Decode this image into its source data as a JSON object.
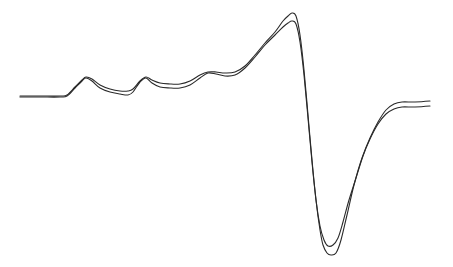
{
  "chart_data": {
    "type": "line",
    "title": "",
    "xlabel": "",
    "ylabel": "",
    "grid": false,
    "axes_visible": false,
    "legend": null,
    "x_pixel_range": [
      20,
      430
    ],
    "y_pixel_range": [
      13,
      255
    ],
    "series": [
      {
        "name": "trace-1",
        "color": "#2a2a2a",
        "points": [
          [
            20,
            96
          ],
          [
            40,
            96
          ],
          [
            60,
            96
          ],
          [
            67,
            95
          ],
          [
            75,
            87
          ],
          [
            82,
            80
          ],
          [
            86,
            77
          ],
          [
            92,
            79
          ],
          [
            100,
            85
          ],
          [
            110,
            89
          ],
          [
            120,
            91
          ],
          [
            128,
            91
          ],
          [
            133,
            89
          ],
          [
            140,
            81
          ],
          [
            146,
            77
          ],
          [
            152,
            80
          ],
          [
            160,
            83
          ],
          [
            170,
            84
          ],
          [
            180,
            84
          ],
          [
            190,
            81
          ],
          [
            200,
            75
          ],
          [
            208,
            72
          ],
          [
            216,
            72
          ],
          [
            225,
            73
          ],
          [
            235,
            72
          ],
          [
            245,
            66
          ],
          [
            255,
            55
          ],
          [
            265,
            43
          ],
          [
            275,
            32
          ],
          [
            283,
            21
          ],
          [
            288,
            16
          ],
          [
            292,
            13
          ],
          [
            296,
            16
          ],
          [
            300,
            35
          ],
          [
            304,
            70
          ],
          [
            308,
            115
          ],
          [
            312,
            160
          ],
          [
            316,
            200
          ],
          [
            320,
            230
          ],
          [
            323,
            245
          ],
          [
            327,
            253
          ],
          [
            331,
            255
          ],
          [
            336,
            253
          ],
          [
            341,
            240
          ],
          [
            347,
            215
          ],
          [
            354,
            185
          ],
          [
            362,
            158
          ],
          [
            370,
            138
          ],
          [
            378,
            122
          ],
          [
            386,
            110
          ],
          [
            394,
            104
          ],
          [
            402,
            102
          ],
          [
            415,
            102
          ],
          [
            430,
            101
          ]
        ]
      },
      {
        "name": "trace-2",
        "color": "#2a2a2a",
        "points": [
          [
            20,
            97
          ],
          [
            40,
            97
          ],
          [
            60,
            97
          ],
          [
            67,
            96
          ],
          [
            75,
            88
          ],
          [
            82,
            81
          ],
          [
            86,
            78
          ],
          [
            92,
            81
          ],
          [
            100,
            88
          ],
          [
            110,
            92
          ],
          [
            120,
            94
          ],
          [
            128,
            95
          ],
          [
            133,
            92
          ],
          [
            140,
            82
          ],
          [
            146,
            78
          ],
          [
            152,
            83
          ],
          [
            160,
            87
          ],
          [
            170,
            88
          ],
          [
            180,
            88
          ],
          [
            190,
            85
          ],
          [
            200,
            78
          ],
          [
            208,
            73
          ],
          [
            216,
            74
          ],
          [
            225,
            76
          ],
          [
            235,
            75
          ],
          [
            245,
            68
          ],
          [
            255,
            57
          ],
          [
            265,
            45
          ],
          [
            275,
            35
          ],
          [
            283,
            27
          ],
          [
            288,
            23
          ],
          [
            292,
            21
          ],
          [
            296,
            24
          ],
          [
            300,
            42
          ],
          [
            304,
            75
          ],
          [
            308,
            118
          ],
          [
            312,
            162
          ],
          [
            316,
            200
          ],
          [
            320,
            226
          ],
          [
            324,
            240
          ],
          [
            328,
            246
          ],
          [
            333,
            245
          ],
          [
            338,
            238
          ],
          [
            343,
            222
          ],
          [
            349,
            200
          ],
          [
            356,
            178
          ],
          [
            363,
            156
          ],
          [
            370,
            139
          ],
          [
            378,
            124
          ],
          [
            386,
            114
          ],
          [
            394,
            109
          ],
          [
            402,
            107
          ],
          [
            415,
            107
          ],
          [
            430,
            106
          ]
        ]
      }
    ]
  }
}
